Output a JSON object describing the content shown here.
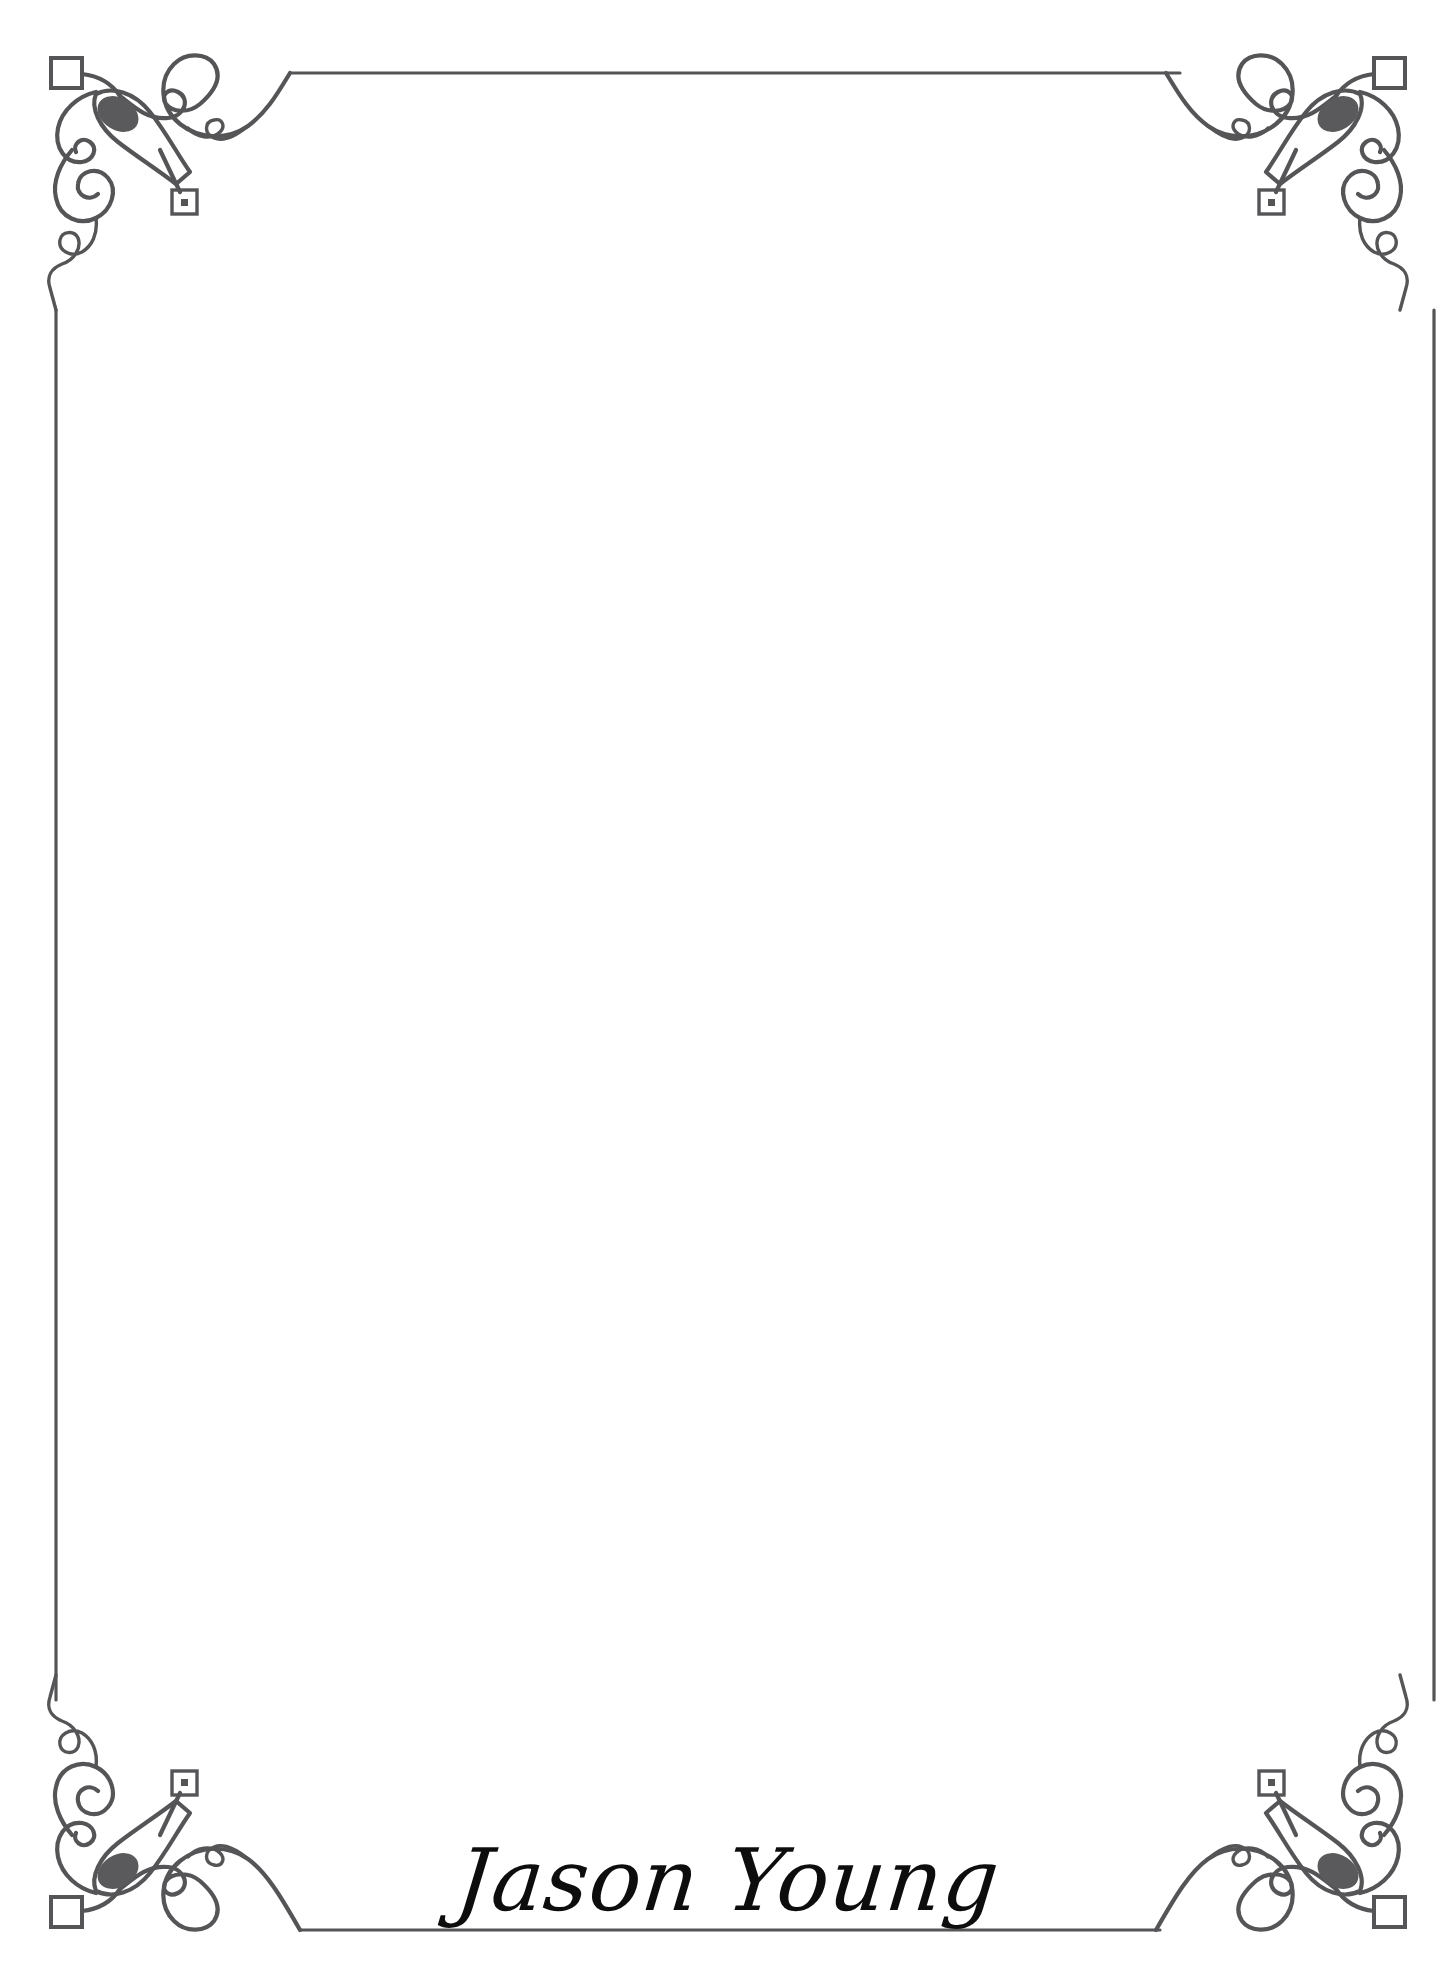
{
  "page": {
    "background_color": "#ffffff",
    "width": 1456,
    "height": 1985,
    "document_type": "ornamental-bordered-stationery"
  },
  "frame": {
    "line_color": "#555558",
    "leaf_fill_color": "#5a5a5d",
    "style_name": "flourish-scroll-border",
    "corner_ornaments": [
      {
        "position": "top-left",
        "name": "corner-ornament-top-left"
      },
      {
        "position": "top-right",
        "name": "corner-ornament-top-right"
      },
      {
        "position": "bottom-left",
        "name": "corner-ornament-bottom-left"
      },
      {
        "position": "bottom-right",
        "name": "corner-ornament-bottom-right"
      }
    ],
    "border_edges": [
      "top",
      "right",
      "bottom",
      "left"
    ]
  },
  "content": {
    "body_text": "",
    "placeholder": ""
  },
  "signature": {
    "name": "Jason Young",
    "color": "#0d0d0d",
    "alignment": "center"
  }
}
